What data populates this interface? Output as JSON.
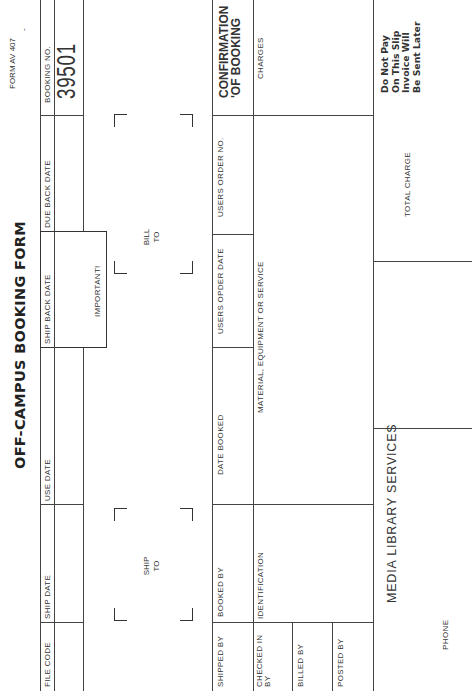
{
  "header": {
    "title": "OFF-CAMPUS BOOKING FORM",
    "form_number": "FORM AV 407",
    "form_number_mark": "-"
  },
  "row1": {
    "file_code": {
      "label": "FILE CODE",
      "value": ""
    },
    "ship_date": {
      "label": "SHIP DATE",
      "value": ""
    },
    "use_date": {
      "label": "USE DATE",
      "value": ""
    },
    "ship_back_date": {
      "label": "SHIP BACK DATE",
      "value": "",
      "note": "IMPORTANT!"
    },
    "due_back_date": {
      "label": "DUE BACK DATE",
      "value": ""
    },
    "booking_no": {
      "label": "BOOKING NO.",
      "value": "39501"
    }
  },
  "address": {
    "ship_to": {
      "line1": "SHIP",
      "line2": "TO",
      "value": ""
    },
    "bill_to": {
      "line1": "BILL",
      "line2": "TO",
      "value": ""
    }
  },
  "row2": {
    "shipped_by": {
      "label": "SHIPPED BY",
      "value": ""
    },
    "booked_by": {
      "label": "BOOKED BY",
      "value": ""
    },
    "date_booked": {
      "label": "DATE BOOKED",
      "value": ""
    },
    "users_order_date": {
      "label": "USERS OPDER DATE",
      "value": ""
    },
    "users_order_no": {
      "label": "USERS ORDER NO.",
      "value": ""
    },
    "confirmation": {
      "line1": "CONFIRMATION",
      "line2": "'OF BOOKING"
    }
  },
  "row3": {
    "checked_in_by": {
      "line1": "CHECKED IN",
      "line2": "BY",
      "value": ""
    },
    "billed_by": {
      "label": "BILLED BY",
      "value": ""
    },
    "posted_by": {
      "label": "POSTED BY",
      "value": ""
    },
    "identification": {
      "label": "IDENTIFICATION",
      "value": ""
    },
    "material": {
      "label": "MATERIAL, EQUIPMENT OR SERVICE",
      "value": ""
    },
    "charges": {
      "label": "CHARGES",
      "value": ""
    }
  },
  "footer": {
    "department": "MEDIA LIBRARY SERVICES",
    "phone_label": "PHONE",
    "total_charge_label": "TOTAL CHARGE",
    "total_charge_value": "",
    "notice": [
      "Do Not Pay",
      "On This Slip",
      "Invoice Will",
      "Be Sent Later"
    ]
  }
}
